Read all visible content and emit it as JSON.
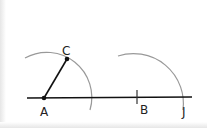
{
  "diagram": {
    "points": {
      "A": {
        "label": "A",
        "x": 44,
        "y": 98
      },
      "B": {
        "label": "B",
        "x": 137,
        "y": 98
      },
      "C": {
        "label": "C",
        "x": 67,
        "y": 59
      },
      "J": {
        "label": "J",
        "x": 183,
        "y": 98
      }
    },
    "colors": {
      "line": "#111111",
      "arc": "#999999",
      "label": "#222222"
    }
  }
}
